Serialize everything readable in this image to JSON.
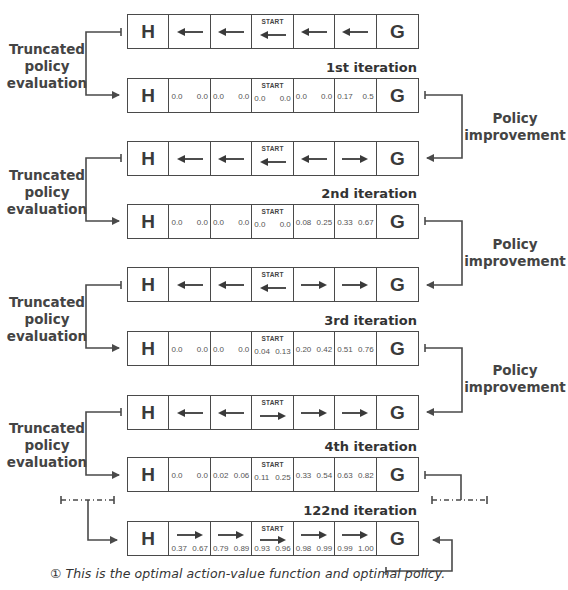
{
  "labels": {
    "truncated_policy_evaluation": [
      "Truncated",
      "policy",
      "evaluation"
    ],
    "policy_improvement": [
      "Policy",
      "improvement"
    ],
    "start": "START",
    "hole": "H",
    "goal": "G",
    "note_icon": "①",
    "note": "This is the optimal action-value function and optimal policy."
  },
  "rows": [
    {
      "type": "policy",
      "top": 14,
      "arrows": [
        "left",
        "left",
        "left",
        "left",
        "left"
      ]
    },
    {
      "type": "values",
      "top": 78,
      "iteration_label": "1st iteration",
      "values": [
        [
          "0.0",
          "0.0"
        ],
        [
          "0.0",
          "0.0"
        ],
        [
          "0.0",
          "0.0"
        ],
        [
          "0.0",
          "0.0"
        ],
        [
          "0.17",
          "0.5"
        ]
      ]
    },
    {
      "type": "policy",
      "top": 141,
      "arrows": [
        "left",
        "left",
        "left",
        "left",
        "right"
      ]
    },
    {
      "type": "values",
      "top": 204,
      "iteration_label": "2nd iteration",
      "values": [
        [
          "0.0",
          "0.0"
        ],
        [
          "0.0",
          "0.0"
        ],
        [
          "0.0",
          "0.0"
        ],
        [
          "0.08",
          "0.25"
        ],
        [
          "0.33",
          "0.67"
        ]
      ]
    },
    {
      "type": "policy",
      "top": 267,
      "arrows": [
        "left",
        "left",
        "left",
        "right",
        "right"
      ]
    },
    {
      "type": "values",
      "top": 331,
      "iteration_label": "3rd iteration",
      "values": [
        [
          "0.0",
          "0.0"
        ],
        [
          "0.0",
          "0.0"
        ],
        [
          "0.04",
          "0.13"
        ],
        [
          "0.20",
          "0.42"
        ],
        [
          "0.51",
          "0.76"
        ]
      ]
    },
    {
      "type": "policy",
      "top": 395,
      "arrows": [
        "left",
        "left",
        "right",
        "right",
        "right"
      ]
    },
    {
      "type": "values",
      "top": 457,
      "iteration_label": "4th iteration",
      "values": [
        [
          "0.0",
          "0.0"
        ],
        [
          "0.02",
          "0.06"
        ],
        [
          "0.11",
          "0.25"
        ],
        [
          "0.33",
          "0.54"
        ],
        [
          "0.63",
          "0.82"
        ]
      ]
    },
    {
      "type": "both",
      "top": 521,
      "iteration_label": "122nd iteration",
      "arrows": [
        "right",
        "right",
        "right",
        "right",
        "right"
      ],
      "values": [
        [
          "0.37",
          "0.67"
        ],
        [
          "0.79",
          "0.89"
        ],
        [
          "0.93",
          "0.96"
        ],
        [
          "0.98",
          "0.99"
        ],
        [
          "0.99",
          "1.00"
        ]
      ]
    }
  ],
  "colors": {
    "line": "#4a4a4a",
    "text": "#3a3a3a",
    "background": "#ffffff"
  }
}
